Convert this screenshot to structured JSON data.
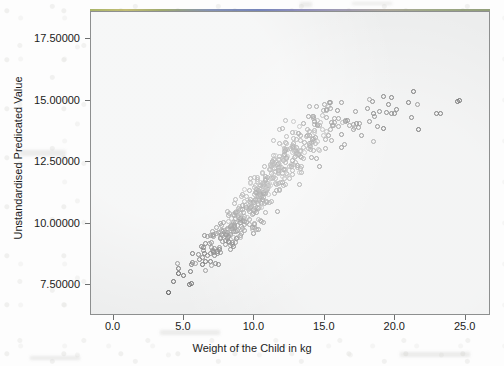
{
  "chart_data": {
    "type": "scatter",
    "title": "",
    "xlabel": "Weight of the Child in kg",
    "ylabel": "Unstandardised Predicated Value",
    "xlim": [
      -1.6,
      26.8
    ],
    "ylim": [
      6.25,
      18.6
    ],
    "xticks": [
      0.0,
      5.0,
      10.0,
      15.0,
      20.0,
      25.0
    ],
    "xticklabels": [
      "0.0",
      "5.0",
      "10.0",
      "15.0",
      "20.0",
      "25.0"
    ],
    "yticks": [
      7.5,
      10.0,
      12.5,
      15.0,
      17.5
    ],
    "yticklabels": [
      "7.50000",
      "10.00000",
      "12.50000",
      "15.00000",
      "17.50000"
    ],
    "grid": false,
    "legend": null,
    "marker": "open-circle",
    "marker_size_px": 5,
    "marker_edge_color": "#3b3b3b",
    "marker_face_color": "none",
    "plot_bg_color": "#eceded",
    "n_points": 520,
    "trend": {
      "form": "saturating",
      "knots_x": [
        3.0,
        5.0,
        7.5,
        10.0,
        12.5,
        15.0,
        17.5,
        20.0,
        22.5,
        25.0
      ],
      "knots_y": [
        7.6,
        8.2,
        9.3,
        10.9,
        12.7,
        13.9,
        14.3,
        14.5,
        14.6,
        14.6
      ],
      "spread_y": [
        0.45,
        0.55,
        0.75,
        0.95,
        1.05,
        0.95,
        0.8,
        0.7,
        0.6,
        0.55
      ]
    },
    "x_density": {
      "bins": [
        3,
        4,
        5,
        6,
        7,
        8,
        9,
        10,
        11,
        12,
        13,
        14,
        15,
        16,
        17,
        18,
        19,
        20,
        21,
        22,
        23,
        24,
        25
      ],
      "counts": [
        1,
        2,
        6,
        14,
        30,
        48,
        62,
        70,
        68,
        58,
        48,
        38,
        24,
        14,
        9,
        7,
        6,
        5,
        3,
        2,
        2,
        1,
        2
      ]
    },
    "x_range_observed": [
      3.0,
      24.6
    ],
    "y_range_observed": [
      6.8,
      15.9
    ]
  },
  "axes": {
    "plot_area": {
      "left_px": 90,
      "top_px": 11,
      "width_px": 400,
      "height_px": 304
    }
  }
}
